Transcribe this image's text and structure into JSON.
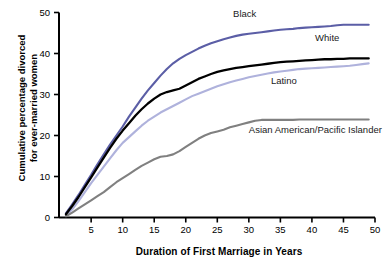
{
  "chart_data": {
    "type": "line",
    "title": "",
    "subtitle": "",
    "xlabel": "Duration of First Marriage in Years",
    "ylabel": "Cumulative percentage divorced for ever-married women",
    "ylabel_line1": "Cumulative percentage divorced",
    "ylabel_line2": "for ever-married women",
    "xlim": [
      0,
      50
    ],
    "ylim": [
      0,
      50
    ],
    "xticks": [
      5,
      10,
      15,
      20,
      25,
      30,
      35,
      40,
      45,
      50
    ],
    "yticks": [
      0,
      10,
      20,
      30,
      40,
      50
    ],
    "grid": false,
    "legend_position": "inline-annotations",
    "x": [
      1,
      2,
      3,
      4,
      5,
      6,
      7,
      8,
      9,
      10,
      11,
      12,
      13,
      14,
      15,
      16,
      17,
      18,
      19,
      20,
      21,
      22,
      23,
      24,
      25,
      26,
      27,
      28,
      29,
      30,
      31,
      32,
      33,
      34,
      35,
      36,
      37,
      38,
      39,
      40,
      41,
      42,
      43,
      44,
      45,
      46,
      47,
      48,
      49
    ],
    "series": [
      {
        "name": "Black",
        "color": "#5B5EA6",
        "values": [
          1.0,
          3.2,
          5.5,
          8.0,
          10.4,
          13.0,
          15.4,
          17.8,
          20.0,
          22.2,
          24.6,
          26.8,
          29.0,
          31.0,
          32.8,
          34.6,
          36.2,
          37.6,
          38.7,
          39.6,
          40.4,
          41.2,
          41.9,
          42.5,
          43.0,
          43.5,
          43.9,
          44.3,
          44.6,
          44.8,
          45.0,
          45.2,
          45.4,
          45.6,
          45.8,
          45.9,
          46.0,
          46.2,
          46.3,
          46.4,
          46.5,
          46.6,
          46.7,
          46.9,
          47.0,
          47.0,
          47.0,
          47.0,
          47.0
        ]
      },
      {
        "name": "White",
        "color": "#000000",
        "values": [
          0.8,
          2.8,
          5.0,
          7.4,
          9.8,
          12.2,
          14.6,
          17.0,
          19.2,
          21.2,
          23.0,
          24.8,
          26.4,
          27.8,
          29.0,
          30.0,
          30.6,
          31.0,
          31.4,
          32.2,
          33.0,
          33.8,
          34.4,
          35.0,
          35.5,
          35.9,
          36.2,
          36.5,
          36.7,
          36.9,
          37.1,
          37.3,
          37.5,
          37.7,
          37.9,
          38.0,
          38.1,
          38.2,
          38.3,
          38.4,
          38.5,
          38.6,
          38.6,
          38.7,
          38.7,
          38.8,
          38.8,
          38.8,
          38.8
        ]
      },
      {
        "name": "Latino",
        "color": "#AFB2DC",
        "values": [
          0.4,
          2.0,
          4.0,
          6.2,
          8.4,
          10.4,
          12.4,
          14.4,
          16.4,
          18.2,
          19.6,
          21.0,
          22.4,
          23.6,
          24.6,
          25.6,
          26.4,
          27.2,
          28.0,
          28.8,
          29.6,
          30.2,
          30.8,
          31.4,
          32.0,
          32.5,
          33.0,
          33.4,
          33.8,
          34.2,
          34.5,
          34.8,
          35.1,
          35.4,
          35.6,
          35.8,
          36.0,
          36.2,
          36.3,
          36.4,
          36.5,
          36.6,
          36.7,
          36.8,
          36.9,
          37.0,
          37.2,
          37.4,
          37.6
        ]
      },
      {
        "name": "Asian American/Pacific Islander",
        "color": "#808080",
        "values": [
          0.3,
          1.2,
          2.2,
          3.2,
          4.2,
          5.2,
          6.2,
          7.4,
          8.6,
          9.6,
          10.6,
          11.6,
          12.6,
          13.4,
          14.2,
          14.8,
          15.0,
          15.4,
          16.2,
          17.2,
          18.2,
          19.2,
          20.0,
          20.6,
          21.0,
          21.4,
          22.0,
          22.4,
          22.8,
          23.2,
          23.6,
          23.8,
          23.8,
          23.8,
          23.8,
          23.8,
          23.8,
          23.9,
          23.9,
          23.9,
          23.9,
          23.9,
          23.9,
          23.9,
          23.9,
          23.9,
          23.9,
          23.9,
          23.9
        ]
      }
    ],
    "annotations": [
      {
        "text": "Black",
        "x": 27.5,
        "y": 49.5
      },
      {
        "text": "White",
        "x": 40.5,
        "y": 43.5
      },
      {
        "text": "Latino",
        "x": 33.5,
        "y": 33.0
      },
      {
        "text": "Asian American/Pacific Islander",
        "x": 30.0,
        "y": 21.0
      }
    ]
  },
  "axes": {
    "x_title": "Duration of First Marriage in Years",
    "y_title_line1": "Cumulative percentage divorced",
    "y_title_line2": "for ever-married women",
    "x_tick_labels": [
      "5",
      "10",
      "15",
      "20",
      "25",
      "30",
      "35",
      "40",
      "45",
      "50"
    ],
    "y_tick_labels": [
      "0",
      "10",
      "20",
      "30",
      "40",
      "50"
    ]
  },
  "labels": {
    "black": "Black",
    "white": "White",
    "latino": "Latino",
    "asian": "Asian American/Pacific Islander"
  },
  "colors": {
    "black_series": "#5B5EA6",
    "white_series": "#000000",
    "latino_series": "#AFB2DC",
    "asian_series": "#808080",
    "axis": "#000000",
    "background": "#ffffff"
  }
}
